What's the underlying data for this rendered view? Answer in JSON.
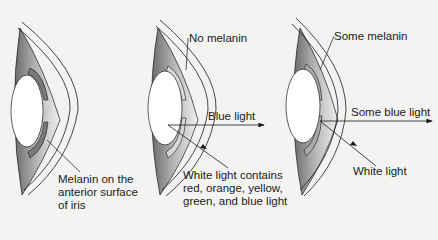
{
  "diagram": {
    "panels": [
      {
        "id": "brown-eye",
        "labels": {
          "melanin": [
            "Melanin on the",
            "anterior surface",
            "of iris"
          ]
        }
      },
      {
        "id": "blue-eye",
        "labels": {
          "melanin": "No melanin",
          "reflected": "Blue light",
          "incident": [
            "White light contains",
            "red, orange, yellow,",
            "green, and blue light"
          ]
        }
      },
      {
        "id": "green-eye",
        "labels": {
          "melanin": "Some melanin",
          "reflected": "Some blue light",
          "incident": "White light"
        }
      }
    ],
    "colors": {
      "background": "#f3f3f2",
      "line": "#1a1a1a",
      "iris_shade": "#9a9a9a",
      "lens": "#ffffff"
    }
  }
}
